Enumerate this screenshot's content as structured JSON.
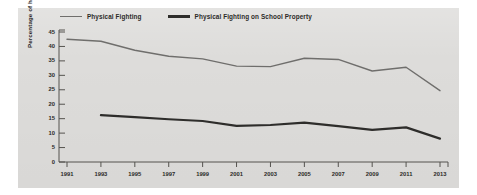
{
  "chart_data": {
    "type": "line",
    "title": "",
    "xlabel": "",
    "ylabel": "Percentage of high school students",
    "x": [
      1991,
      1993,
      1995,
      1997,
      1999,
      2001,
      2003,
      2005,
      2007,
      2009,
      2011,
      2013
    ],
    "xlim": [
      1991,
      2013
    ],
    "ylim": [
      0,
      45
    ],
    "ytick_labels": [
      "0",
      "5",
      "10",
      "15",
      "20",
      "25",
      "30",
      "35",
      "40",
      "45"
    ],
    "ytick_values": [
      0,
      5,
      10,
      15,
      20,
      25,
      30,
      35,
      40,
      45
    ],
    "xtick_labels": [
      "1991",
      "1993",
      "1995",
      "1997",
      "1999",
      "2001",
      "2003",
      "2005",
      "2007",
      "2009",
      "2011",
      "2013"
    ],
    "grid": false,
    "legend_position": "top",
    "series": [
      {
        "name": "Physical Fighting",
        "color": "#6f6e6c",
        "line_width": 1.4,
        "x": [
          1991,
          1993,
          1995,
          1997,
          1999,
          2001,
          2003,
          2005,
          2007,
          2009,
          2011,
          2013
        ],
        "values": [
          42.5,
          41.8,
          38.7,
          36.6,
          35.7,
          33.2,
          33.0,
          35.9,
          35.5,
          31.5,
          32.8,
          24.7
        ]
      },
      {
        "name": "Physical Fighting on School Property",
        "color": "#2e2d2b",
        "line_width": 2.2,
        "x": [
          1993,
          1995,
          1997,
          1999,
          2001,
          2003,
          2005,
          2007,
          2009,
          2011,
          2013
        ],
        "values": [
          16.2,
          15.5,
          14.8,
          14.2,
          12.5,
          12.8,
          13.6,
          12.4,
          11.1,
          12.0,
          8.1
        ]
      }
    ]
  },
  "legend": {
    "entries": [
      {
        "label": "Physical Fighting",
        "swatch": "thin-line-swatch"
      },
      {
        "label": "Physical Fighting on School Property",
        "swatch": "thick-line-swatch"
      }
    ]
  },
  "axes": {
    "y_title": "Percentage of high school students"
  }
}
